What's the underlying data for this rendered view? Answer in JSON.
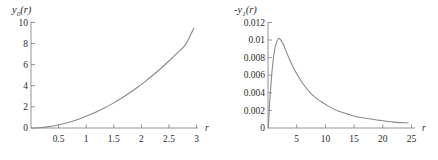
{
  "figure": {
    "panel_count": 2,
    "line_color": "#8a8a8a",
    "axis_color": "#7a7a7a",
    "text_color": "#2b2b2b",
    "background": "#ffffff"
  },
  "left_panel": {
    "y_axis_title_main": "y",
    "y_axis_title_sub": "0",
    "y_axis_title_arg": "(r)",
    "x_axis_name": "r",
    "ytick_labels": [
      "10",
      "8",
      "6",
      "4",
      "2",
      "0"
    ],
    "xtick_labels": [
      "0.5",
      "1",
      "1.5",
      "2",
      "2.5",
      "3"
    ]
  },
  "right_panel": {
    "y_axis_title_main": "-y",
    "y_axis_title_sub": "1",
    "y_axis_title_arg": "(r)",
    "x_axis_name": "r",
    "ytick_labels": [
      "0.012",
      "0.01",
      "0.008",
      "0.006",
      "0.004",
      "0.002",
      "0"
    ],
    "xtick_labels": [
      "5",
      "10",
      "15",
      "20",
      "25"
    ]
  },
  "chart_data": [
    {
      "type": "line",
      "title": "y0(r)",
      "xlabel": "r",
      "ylabel": "y0(r)",
      "xlim": [
        0,
        3.05
      ],
      "ylim": [
        0,
        10.4
      ],
      "xticks": [
        0.5,
        1,
        1.5,
        2,
        2.5,
        3
      ],
      "xticklabels": [
        "0.5",
        "1",
        "1.5",
        "2",
        "2.5",
        "3"
      ],
      "yticks": [
        0,
        2,
        4,
        6,
        8,
        10
      ],
      "yticklabels": [
        "0",
        "2",
        "4",
        "6",
        "8",
        "10"
      ],
      "grid": false,
      "legend": "none",
      "series": [
        {
          "name": "y0(r)",
          "color": "#8a8a8a",
          "x": [
            0,
            0.15,
            0.3,
            0.45,
            0.6,
            0.75,
            0.9,
            1.05,
            1.2,
            1.35,
            1.5,
            1.65,
            1.8,
            1.95,
            2.1,
            2.25,
            2.4,
            2.55,
            2.7,
            2.85,
            3.0
          ],
          "y": [
            0,
            0.03,
            0.11,
            0.24,
            0.42,
            0.64,
            0.91,
            1.22,
            1.57,
            1.96,
            2.4,
            2.88,
            3.4,
            3.96,
            4.57,
            5.22,
            5.91,
            6.65,
            7.42,
            8.24,
            9.85
          ]
        }
      ]
    },
    {
      "type": "line",
      "title": "-y1(r)",
      "xlabel": "r",
      "ylabel": "-y1(r)",
      "xlim": [
        0,
        25.6
      ],
      "ylim": [
        0,
        0.0125
      ],
      "xticks": [
        5,
        10,
        15,
        20,
        25
      ],
      "xticklabels": [
        "5",
        "10",
        "15",
        "20",
        "25"
      ],
      "yticks": [
        0,
        0.002,
        0.004,
        0.006,
        0.008,
        0.01,
        0.012
      ],
      "yticklabels": [
        "0",
        "0.002",
        "0.004",
        "0.006",
        "0.008",
        "0.01",
        "0.012"
      ],
      "grid": false,
      "legend": "none",
      "peak": {
        "x": 1.9,
        "y": 0.0106
      },
      "series": [
        {
          "name": "-y1(r)",
          "color": "#8a8a8a",
          "x": [
            0.05,
            0.3,
            0.6,
            0.9,
            1.2,
            1.5,
            1.9,
            2.3,
            2.8,
            3.4,
            4.0,
            4.8,
            5.6,
            6.5,
            7.5,
            8.5,
            9.5,
            11,
            12.5,
            14,
            16,
            18,
            20,
            22.5,
            25
          ],
          "y": [
            0.0,
            0.003,
            0.0058,
            0.0079,
            0.0093,
            0.0101,
            0.0106,
            0.0104,
            0.0098,
            0.0088,
            0.0079,
            0.0068,
            0.0059,
            0.005,
            0.0042,
            0.0036,
            0.0031,
            0.0025,
            0.002,
            0.0017,
            0.0013,
            0.0011,
            0.0009,
            0.0007,
            0.0006
          ]
        }
      ]
    }
  ]
}
